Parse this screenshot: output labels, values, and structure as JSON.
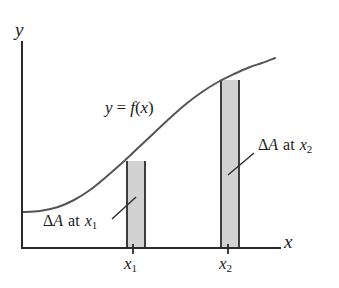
{
  "figure": {
    "kind": "calculus-area-element-diagram",
    "background_color": "#ffffff",
    "ink_color": "#333333",
    "shade_fill_color": "#d2d2d2",
    "shade_edge_color": "#2b2b2b"
  },
  "axes": {
    "y_axis_label": "y",
    "x_axis_label": "x",
    "origin": {
      "x": 22,
      "y": 248
    },
    "x_axis_end": {
      "x": 280,
      "y": 248
    },
    "y_axis_top": {
      "x": 22,
      "y": 42
    },
    "line_width": 2.0
  },
  "curve": {
    "label": "y = f(x)",
    "label_parts": {
      "y": "y",
      "equals": "=",
      "f": "f",
      "open": "(",
      "arg": "x",
      "close": ")"
    },
    "description": "increasing S-shaped (sigmoid) curve, flat at left, steep in middle, flattening at right",
    "stroke_width": 2.0,
    "points": [
      [
        22,
        212
      ],
      [
        40,
        211
      ],
      [
        58,
        207
      ],
      [
        74,
        200
      ],
      [
        90,
        190
      ],
      [
        106,
        177
      ],
      [
        122,
        163
      ],
      [
        138,
        148
      ],
      [
        154,
        133
      ],
      [
        170,
        118
      ],
      [
        186,
        104
      ],
      [
        202,
        92
      ],
      [
        218,
        82
      ],
      [
        234,
        74
      ],
      [
        250,
        67
      ],
      [
        262,
        63
      ],
      [
        275,
        58
      ]
    ]
  },
  "rectangles": [
    {
      "name": "area-element-x1",
      "x_left": 127,
      "x_right": 145,
      "y_top": 161,
      "y_bottom": 248,
      "fill": "#d2d2d2"
    },
    {
      "name": "area-element-x2",
      "x_left": 221,
      "x_right": 239,
      "y_top": 80,
      "y_bottom": 248,
      "fill": "#d2d2d2"
    }
  ],
  "ticks": [
    {
      "label_base": "x",
      "label_sub": "1",
      "x": 133,
      "y": 266
    },
    {
      "label_base": "x",
      "label_sub": "2",
      "x": 228,
      "y": 266
    }
  ],
  "tick_marks": [
    {
      "x": 133,
      "y_top": 244,
      "y_bottom": 254
    },
    {
      "x": 228,
      "y_top": 244,
      "y_bottom": 254
    }
  ],
  "annotations": [
    {
      "name": "delta-a-at-x1",
      "delta": "Δ",
      "var": "A",
      "word": "at",
      "sub_base": "x",
      "sub_index": "1",
      "text": "ΔA at x₁",
      "text_x": 43,
      "text_y": 214,
      "leader_from": {
        "x": 112,
        "y": 219
      },
      "leader_to": {
        "x": 136,
        "y": 197
      }
    },
    {
      "name": "delta-a-at-x2",
      "delta": "Δ",
      "var": "A",
      "word": "at",
      "sub_base": "x",
      "sub_index": "2",
      "text": "ΔA at x₂",
      "text_x": 258,
      "text_y": 138,
      "leader_from": {
        "x": 228,
        "y": 175
      },
      "leader_to": {
        "x": 254,
        "y": 153
      }
    }
  ],
  "chart_data": {
    "type": "line",
    "title": "",
    "xlabel": "x",
    "ylabel": "y",
    "legend": [],
    "grid": false,
    "series": [
      {
        "name": "y = f(x)",
        "x": [
          22,
          40,
          58,
          74,
          90,
          106,
          122,
          138,
          154,
          170,
          186,
          202,
          218,
          234,
          250,
          262,
          275
        ],
        "y": [
          212,
          211,
          207,
          200,
          190,
          177,
          163,
          148,
          133,
          118,
          104,
          92,
          82,
          74,
          67,
          63,
          58
        ]
      }
    ],
    "annotations": [
      "y = f(x)",
      "ΔA at x₁",
      "ΔA at x₂"
    ],
    "tick_labels": {
      "x": [
        "x₁",
        "x₂"
      ],
      "y": []
    },
    "shaded_regions": [
      {
        "label": "ΔA at x₁",
        "x_left": 127,
        "x_right": 145
      },
      {
        "label": "ΔA at x₂",
        "x_left": 221,
        "x_right": 239
      }
    ]
  }
}
